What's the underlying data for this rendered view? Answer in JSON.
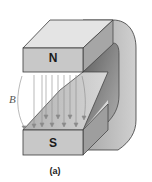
{
  "figure": {
    "caption": "(a)",
    "north_pole_label": "N",
    "south_pole_label": "S",
    "field_label": "B",
    "field_line_count": 10,
    "colors": {
      "magnet_front": "#c8c8c8",
      "magnet_top": "#e4e4e4",
      "magnet_side": "#9a9a9a",
      "magnet_inner": "#7a7a7a",
      "field_lines": "#8a8a8a",
      "outline": "#3a3a3a"
    }
  }
}
